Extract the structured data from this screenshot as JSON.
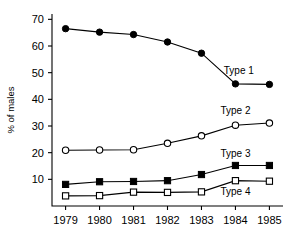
{
  "chart_data": {
    "type": "line",
    "title": "",
    "subtitle": "",
    "xlabel": "",
    "ylabel": "% of males",
    "x": [
      1979,
      1980,
      1981,
      1982,
      1983,
      1984,
      1985
    ],
    "xtick_labels": [
      "1979",
      "1980",
      "1981",
      "1982",
      "1983",
      "1984",
      "1985"
    ],
    "ytick_labels": [
      "10",
      "20",
      "30",
      "40",
      "50",
      "60",
      "70"
    ],
    "yticks": [
      10,
      20,
      30,
      40,
      50,
      60,
      70
    ],
    "ylim": [
      0,
      72
    ],
    "xlim": [
      1978.6,
      1985.4
    ],
    "grid": false,
    "legend_position": "inline-right",
    "series": [
      {
        "name": "Type 1",
        "marker": "filled-circle",
        "color": "#000000",
        "values": [
          66.5,
          65.2,
          64.3,
          61.5,
          57.3,
          45.8,
          45.6
        ],
        "label_x": 1984.1,
        "label_y": 49.5
      },
      {
        "name": "Type 2",
        "marker": "open-circle",
        "color": "#000000",
        "values": [
          20.9,
          21.0,
          21.1,
          23.5,
          26.3,
          30.3,
          31.1
        ],
        "label_x": 1984.0,
        "label_y": 34.5
      },
      {
        "name": "Type 3",
        "marker": "filled-square",
        "color": "#000000",
        "values": [
          8.1,
          9.1,
          9.2,
          9.5,
          11.8,
          15.2,
          15.2
        ],
        "label_x": 1984.0,
        "label_y": 18.3
      },
      {
        "name": "Type 4",
        "marker": "open-square",
        "color": "#000000",
        "values": [
          3.8,
          3.9,
          5.2,
          5.1,
          5.3,
          9.5,
          9.3
        ],
        "label_x": 1984.0,
        "label_y": 4.2
      }
    ]
  }
}
